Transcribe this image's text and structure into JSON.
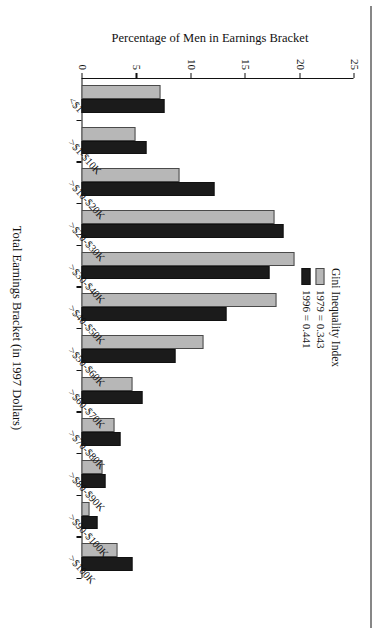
{
  "chart_data": {
    "type": "bar",
    "title": "",
    "xlabel": "Total Earnings Bracket (in 1997 Dollars)",
    "ylabel": "Percentage of Men in Earnings Bracket",
    "ylim": [
      0,
      25
    ],
    "yticks": [
      0,
      5,
      10,
      15,
      20,
      25
    ],
    "grid": false,
    "legend_position": "top-right",
    "legend_title": "Gini Inequality Index",
    "categories": [
      "<$1",
      ">$1-$10K",
      ">$10-$20K",
      ">$20-$30K",
      ">$30-$40K",
      ">$40-$50K",
      ">$50-$60K",
      ">$60-$70K",
      ">$70-$80K",
      ">$80-$90K",
      ">$90-$100K",
      ">$100K"
    ],
    "series": [
      {
        "name": "1979 = 0.343",
        "color": "#b7b7b7",
        "values": [
          7.3,
          5.0,
          9.0,
          17.7,
          19.6,
          17.9,
          11.2,
          4.7,
          3.0,
          1.9,
          0.7,
          3.3
        ]
      },
      {
        "name": "1996 = 0.441",
        "color": "#1b1b1b",
        "values": [
          7.6,
          6.0,
          12.2,
          18.6,
          17.3,
          13.3,
          8.6,
          5.6,
          3.6,
          2.2,
          1.5,
          4.7
        ]
      }
    ]
  },
  "figure": {
    "xaxis_title": "Total Earnings Bracket (in 1997 Dollars)",
    "yaxis_title": "Percentage of Men in Earnings Bracket"
  },
  "legend": {
    "title": "Gini Inequality Index",
    "entries": [
      {
        "label": "1979 = 0.343",
        "swatch": "gray-swatch"
      },
      {
        "label": "1996 = 0.441",
        "swatch": "black-swatch"
      }
    ]
  }
}
